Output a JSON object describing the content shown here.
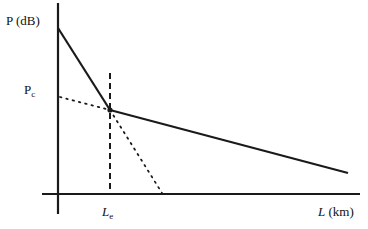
{
  "diagram": {
    "type": "power-budget-vs-length",
    "y_axis_label": "P (dB)",
    "x_axis_label_var": "L",
    "x_axis_label_unit": " (km)",
    "pc_label_main": "P",
    "pc_label_sub": "c",
    "le_label_main": "L",
    "le_label_sub": "e",
    "colors": {
      "line": "#1a1a1a",
      "background": "#ffffff"
    },
    "geometry": {
      "y_axis": {
        "x": 58,
        "y1": 3,
        "y2": 214
      },
      "x_axis": {
        "y": 194,
        "x1": 42,
        "x2": 360
      },
      "solid_segment_1": {
        "x1": 58,
        "y1": 28,
        "x2": 110,
        "y2": 110
      },
      "solid_segment_2": {
        "x1": 110,
        "y1": 110,
        "x2": 348,
        "y2": 173
      },
      "dotted_extension_left": {
        "x1": 60,
        "y1": 97,
        "x2": 110,
        "y2": 110
      },
      "dotted_extension_down": {
        "x1": 110,
        "y1": 110,
        "x2": 162,
        "y2": 193
      },
      "dashed_vertical": {
        "x": 110,
        "y1": 73,
        "y2": 194
      },
      "knee_point": {
        "x": 110,
        "y": 110
      }
    }
  }
}
